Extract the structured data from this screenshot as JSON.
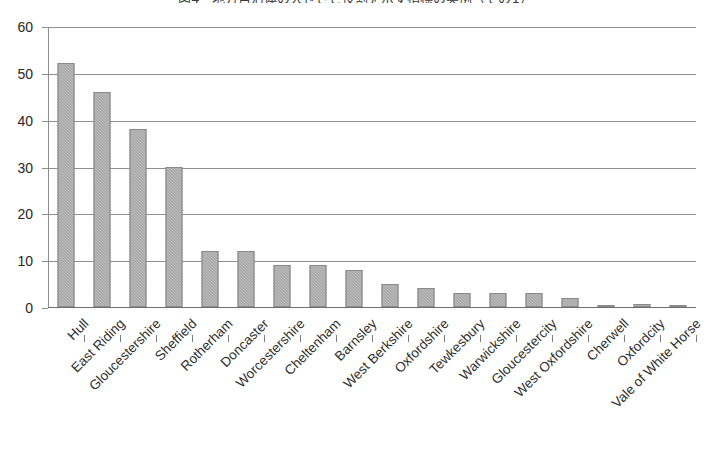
{
  "chart_data": {
    "type": "bar",
    "title": "図4　地方自治体の大きさと役割を示す指標の実例（その1）",
    "xlabel": "",
    "ylabel": "",
    "ylim": [
      0,
      60
    ],
    "ytick_values": [
      0,
      10,
      20,
      30,
      40,
      50,
      60
    ],
    "ytick_labels": [
      "0",
      "10",
      "20",
      "30",
      "40",
      "50",
      "60"
    ],
    "grid": true,
    "legend": false,
    "bar_color": "#9d9d9d",
    "categories": [
      "Hull",
      "East Riding",
      "Gloucestershire",
      "Sheffield",
      "Rotherham",
      "Doncaster",
      "Worcestershire",
      "Cheltenham",
      "Barnsley",
      "West Berkshire",
      "Oxfordshire",
      "Tewkesbury",
      "Warwickshire",
      "Gloucestercity",
      "West Oxfordshire",
      "Cherwell",
      "Oxfordcity",
      "Vale of White Horse"
    ],
    "values": [
      52,
      46,
      38,
      30,
      12,
      12,
      9,
      9,
      8,
      5,
      4,
      3,
      3,
      3,
      2,
      0.5,
      0.7,
      0.4
    ]
  }
}
